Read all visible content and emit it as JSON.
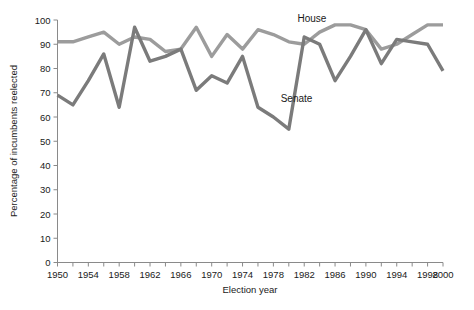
{
  "chart_data": {
    "type": "line",
    "title": "",
    "xlabel": "Election year",
    "ylabel": "Percentage of incumbents reelected",
    "xlim": [
      1950,
      2000
    ],
    "ylim": [
      0,
      100
    ],
    "grid": false,
    "legend_position": "inline-annotation",
    "x_tick_labels": [
      "1950",
      "1954",
      "1958",
      "1962",
      "1966",
      "1970",
      "1974",
      "1978",
      "1982",
      "1986",
      "1990",
      "1994",
      "1998",
      "2000"
    ],
    "x_tick_values": [
      1950,
      1954,
      1958,
      1962,
      1966,
      1970,
      1974,
      1978,
      1982,
      1986,
      1990,
      1994,
      1998,
      2000
    ],
    "x_minor_tick_values": [
      1950,
      1952,
      1954,
      1956,
      1958,
      1960,
      1962,
      1964,
      1966,
      1968,
      1970,
      1972,
      1974,
      1976,
      1978,
      1980,
      1982,
      1984,
      1986,
      1988,
      1990,
      1992,
      1994,
      1996,
      1998,
      2000
    ],
    "y_tick_labels": [
      "0",
      "10",
      "20",
      "30",
      "40",
      "50",
      "60",
      "70",
      "80",
      "90",
      "100"
    ],
    "y_tick_values": [
      0,
      10,
      20,
      30,
      40,
      50,
      60,
      70,
      80,
      90,
      100
    ],
    "x": [
      1950,
      1952,
      1954,
      1956,
      1958,
      1960,
      1962,
      1964,
      1966,
      1968,
      1970,
      1972,
      1974,
      1976,
      1978,
      1980,
      1982,
      1984,
      1986,
      1988,
      1990,
      1992,
      1994,
      1996,
      1998,
      2000
    ],
    "series": [
      {
        "name": "House",
        "color": "#9c9c9c",
        "label": "House",
        "values": [
          91,
          91,
          93,
          95,
          90,
          93,
          92,
          87,
          88,
          97,
          85,
          94,
          88,
          96,
          94,
          91,
          90,
          95,
          98,
          98,
          96,
          88,
          90,
          94,
          98,
          98
        ]
      },
      {
        "name": "Senate",
        "color": "#7b7b7b",
        "label": "Senate",
        "values": [
          69,
          65,
          75,
          86,
          64,
          97,
          83,
          85,
          88,
          71,
          77,
          74,
          85,
          64,
          60,
          55,
          93,
          90,
          75,
          85,
          96,
          82,
          92,
          91,
          90,
          79
        ]
      }
    ],
    "annotations": [
      {
        "text": "House",
        "x": 1983,
        "y": 99,
        "series": "House"
      },
      {
        "text": "Senate",
        "x": 1981,
        "y": 66,
        "series": "Senate"
      }
    ]
  }
}
